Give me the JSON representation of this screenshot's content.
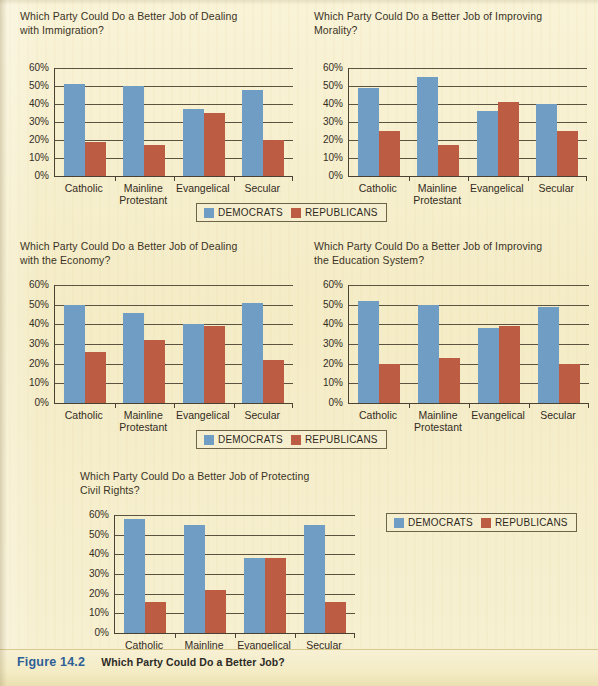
{
  "figure": {
    "number_label": "Figure 14.2",
    "caption": "Which Party Could Do a Better Job?"
  },
  "legend": {
    "democrats_label": "DEMOCRATS",
    "republicans_label": "REPUBLICANS",
    "democrats_color": "#6f9dc4",
    "republicans_color": "#bc5d43"
  },
  "axis": {
    "yticks": [
      "60%",
      "50%",
      "40%",
      "30%",
      "20%",
      "10%",
      "0%"
    ],
    "categories": [
      "Catholic",
      "Mainline\nProtestant",
      "Evangelical",
      "Secular"
    ]
  },
  "chart_data": [
    {
      "type": "bar",
      "title": "Which Party Could Do a Better Job of Dealing\nwith Immigration?",
      "categories": [
        "Catholic",
        "Mainline Protestant",
        "Evangelical",
        "Secular"
      ],
      "series": [
        {
          "name": "DEMOCRATS",
          "color": "#6f9dc4",
          "values": [
            51,
            50,
            37,
            48
          ]
        },
        {
          "name": "REPUBLICANS",
          "color": "#bc5d43",
          "values": [
            19,
            17,
            35,
            20
          ]
        }
      ],
      "xlabel": "",
      "ylabel": "",
      "ylim": [
        0,
        60
      ],
      "ytick_step": 10,
      "grid": true,
      "legend_position": "below"
    },
    {
      "type": "bar",
      "title": "Which Party Could Do a Better Job of  Improving\nMorality?",
      "categories": [
        "Catholic",
        "Mainline Protestant",
        "Evangelical",
        "Secular"
      ],
      "series": [
        {
          "name": "DEMOCRATS",
          "color": "#6f9dc4",
          "values": [
            49,
            55,
            36,
            40
          ]
        },
        {
          "name": "REPUBLICANS",
          "color": "#bc5d43",
          "values": [
            25,
            17,
            41,
            25
          ]
        }
      ],
      "xlabel": "",
      "ylabel": "",
      "ylim": [
        0,
        60
      ],
      "ytick_step": 10,
      "grid": true,
      "legend_position": "below"
    },
    {
      "type": "bar",
      "title": "Which Party Could Do a Better Job of Dealing\nwith the Economy?",
      "categories": [
        "Catholic",
        "Mainline Protestant",
        "Evangelical",
        "Secular"
      ],
      "series": [
        {
          "name": "DEMOCRATS",
          "color": "#6f9dc4",
          "values": [
            50,
            46,
            40,
            51
          ]
        },
        {
          "name": "REPUBLICANS",
          "color": "#bc5d43",
          "values": [
            26,
            32,
            39,
            22
          ]
        }
      ],
      "xlabel": "",
      "ylabel": "",
      "ylim": [
        0,
        60
      ],
      "ytick_step": 10,
      "grid": true,
      "legend_position": "below"
    },
    {
      "type": "bar",
      "title": "Which Party Could Do a  Better Job of  Improving\nthe  Education System?",
      "categories": [
        "Catholic",
        "Mainline Protestant",
        "Evangelical",
        "Secular"
      ],
      "series": [
        {
          "name": "DEMOCRATS",
          "color": "#6f9dc4",
          "values": [
            52,
            50,
            38,
            49
          ]
        },
        {
          "name": "REPUBLICANS",
          "color": "#bc5d43",
          "values": [
            20,
            23,
            39,
            20
          ]
        }
      ],
      "xlabel": "",
      "ylabel": "",
      "ylim": [
        0,
        60
      ],
      "ytick_step": 10,
      "grid": true,
      "legend_position": "below"
    },
    {
      "type": "bar",
      "title": "Which Party Could Do a Better Job of Protecting\nCivil Rights?",
      "categories": [
        "Catholic",
        "Mainline Protestant",
        "Evangelical",
        "Secular"
      ],
      "series": [
        {
          "name": "DEMOCRATS",
          "color": "#6f9dc4",
          "values": [
            58,
            55,
            38,
            55
          ]
        },
        {
          "name": "REPUBLICANS",
          "color": "#bc5d43",
          "values": [
            16,
            22,
            38,
            16
          ]
        }
      ],
      "xlabel": "",
      "ylabel": "",
      "ylim": [
        0,
        60
      ],
      "ytick_step": 10,
      "grid": true,
      "legend_position": "right"
    }
  ]
}
